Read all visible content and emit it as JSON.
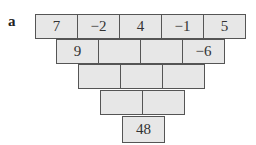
{
  "label": "a",
  "pyramid": {
    "rows": [
      [
        "7",
        "−2",
        "4",
        "−1",
        "5"
      ],
      [
        "9",
        "",
        "",
        "−6"
      ],
      [
        "",
        "",
        ""
      ],
      [
        "",
        ""
      ],
      [
        "48"
      ]
    ]
  },
  "colors": {
    "cell_fill": "#e7e7e7",
    "cell_border": "#555555"
  }
}
